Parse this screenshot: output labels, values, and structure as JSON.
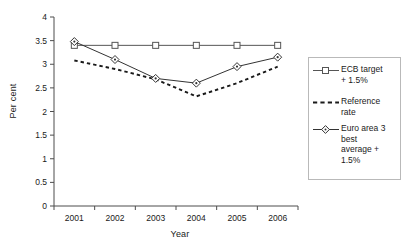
{
  "chart_data": {
    "type": "line",
    "title": "",
    "xlabel": "Year",
    "ylabel": "Per cent",
    "categories": [
      "2001",
      "2002",
      "2003",
      "2004",
      "2005",
      "2006"
    ],
    "x": [
      2001,
      2002,
      2003,
      2004,
      2005,
      2006
    ],
    "xlim": [
      2000.5,
      2006.5
    ],
    "ylim": [
      0,
      4
    ],
    "yticks": [
      "0",
      "0.5",
      "1",
      "1.5",
      "2",
      "2.5",
      "3",
      "3.5",
      "4"
    ],
    "ytick_values": [
      0,
      0.5,
      1,
      1.5,
      2,
      2.5,
      3,
      3.5,
      4
    ],
    "grid": false,
    "legend_position": "right",
    "series": [
      {
        "name": "ECB target + 1.5%",
        "values": [
          3.4,
          3.4,
          3.4,
          3.4,
          3.4,
          3.4
        ],
        "marker": "open-square",
        "linestyle": "solid",
        "color": "#555555"
      },
      {
        "name": "Reference rate",
        "values": [
          3.08,
          2.9,
          2.68,
          2.32,
          2.6,
          2.95
        ],
        "marker": "none",
        "linestyle": "dashed",
        "color": "#1a1a1a"
      },
      {
        "name": "Euro area 3 best average + 1.5%",
        "values": [
          3.48,
          3.1,
          2.7,
          2.6,
          2.95,
          3.15
        ],
        "marker": "open-diamond",
        "linestyle": "solid",
        "color": "#333333"
      }
    ]
  },
  "legend": {
    "items": [
      {
        "label": "ECB target\n+ 1.5%"
      },
      {
        "label": "Reference\nrate"
      },
      {
        "label": "Euro area 3\nbest\naverage +\n1.5%"
      }
    ]
  },
  "axes": {
    "x_title": "Year",
    "y_title": "Per cent"
  },
  "colors": {
    "axis": "#4d4d4d",
    "target_line": "#555555",
    "reference_line": "#1a1a1a",
    "euro_line": "#333333",
    "legend_border": "#b9b9b9",
    "background": "#ffffff"
  }
}
